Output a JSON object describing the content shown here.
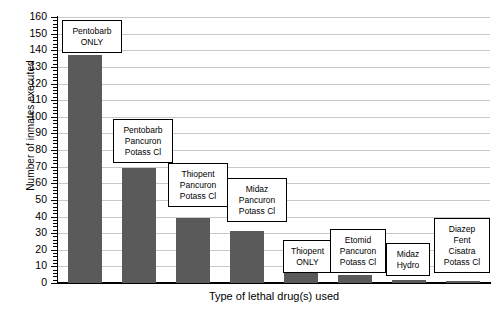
{
  "chart_data": {
    "type": "bar",
    "title": "",
    "xlabel": "Type of lethal drug(s) used",
    "ylabel": "Number of inmates executed",
    "ylim": [
      0,
      160
    ],
    "ytick_step": 10,
    "grid": true,
    "legend": "none",
    "categories": [
      "Pentobarb ONLY",
      "Pentobarb Pancuron Potass Cl",
      "Thiopent Pancuron Potass Cl",
      "Midaz Pancuron Potass Cl",
      "Thiopent ONLY",
      "Etomid Pancuron Potass Cl",
      "Midaz Hydro",
      "Diazep Fent Cisatra Potass Cl"
    ],
    "values": [
      137,
      69,
      39,
      31,
      11,
      5,
      2,
      1
    ],
    "yticks": [
      "0",
      "10",
      "20",
      "30",
      "40",
      "50",
      "60",
      "70",
      "80",
      "90",
      "100",
      "110",
      "120",
      "130",
      "140",
      "150",
      "160"
    ],
    "bar_color": "#5a5a5a",
    "gridline_color": "#c9c9c9",
    "axis_color": "#000000"
  },
  "callouts": [
    {
      "lines": [
        "Pentobarb",
        "ONLY"
      ]
    },
    {
      "lines": [
        "Pentobarb",
        "Pancuron",
        "Potass Cl"
      ]
    },
    {
      "lines": [
        "Thiopent",
        "Pancuron",
        "Potass Cl"
      ]
    },
    {
      "lines": [
        "Midaz",
        "Pancuron",
        "Potass Cl"
      ]
    },
    {
      "lines": [
        "Thiopent",
        "ONLY"
      ]
    },
    {
      "lines": [
        "Etomid",
        "Pancuron",
        "Potass Cl"
      ]
    },
    {
      "lines": [
        "Midaz",
        "Hydro"
      ]
    },
    {
      "lines": [
        "Diazep",
        "Fent",
        "Cisatra",
        "Potass Cl"
      ]
    }
  ]
}
